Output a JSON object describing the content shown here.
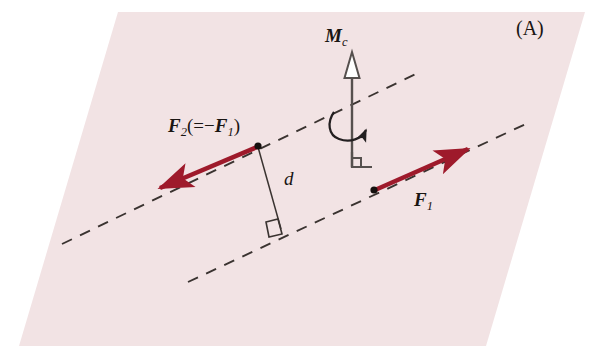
{
  "figure": {
    "panel_label": "(A)",
    "caption_alt": "Force couple: two equal and opposite forces F1 and F2 separated by perpendicular distance d produce a couple moment Mc",
    "plane": {
      "name": "inclined-plane-parallelogram",
      "fill_color": "#f2e3e4",
      "corners": "118,12 585,12 486,346 19,346"
    },
    "colors": {
      "force_red": "#9e1a2b",
      "force_red_dark": "#8c1524",
      "line_black": "#231f20",
      "moment_gray": "#4a4a4a",
      "plane_fill": "#f2e3e4",
      "background": "#ffffff"
    },
    "labels": {
      "f2": {
        "main": "F",
        "sub": "2",
        "paren_open": "(=",
        "minus": "−",
        "neg_main": "F",
        "neg_sub": "1",
        "paren_close": ")"
      },
      "f1": {
        "main": "F",
        "sub": "1"
      },
      "mc": {
        "main": "M",
        "sub": "c"
      },
      "distance": "d",
      "panel": "(A)"
    },
    "elements": {
      "force_arrow_1": {
        "name": "force-vector-f1",
        "label": "F1",
        "from": [
          374,
          190
        ],
        "to": [
          476,
          145
        ],
        "direction": "up-right",
        "color": "#9e1a2b"
      },
      "force_arrow_2": {
        "name": "force-vector-f2",
        "label": "F2 (= -F1)",
        "from": [
          258,
          146
        ],
        "to": [
          152,
          193
        ],
        "direction": "down-left",
        "color": "#9e1a2b"
      },
      "moment_vector": {
        "name": "moment-vector-mc",
        "label": "Mc",
        "from": [
          352,
          166
        ],
        "to": [
          352,
          57
        ],
        "arrowhead_style": "hollow-open",
        "color": "#4a4a4a"
      },
      "rotation_arrow": {
        "name": "rotation-curve-arrow",
        "direction": "counterclockwise-about-axis"
      },
      "right_angle_base": {
        "name": "right-angle-marker-base",
        "at": [
          352,
          166
        ]
      },
      "right_angle_distance": {
        "name": "right-angle-marker-distance",
        "at": [
          280,
          222
        ]
      },
      "distance_line": {
        "name": "perpendicular-distance-d",
        "label": "d",
        "from": [
          258,
          146
        ],
        "to": [
          280,
          228
        ]
      },
      "line_of_action_upper": {
        "name": "line-of-action-upper-dashed",
        "from": [
          62,
          244
        ],
        "to": [
          420,
          72
        ],
        "style": "dashed"
      },
      "line_of_action_lower": {
        "name": "line-of-action-lower-dashed",
        "from": [
          188,
          280
        ],
        "to": [
          530,
          122
        ],
        "style": "dashed"
      }
    }
  }
}
